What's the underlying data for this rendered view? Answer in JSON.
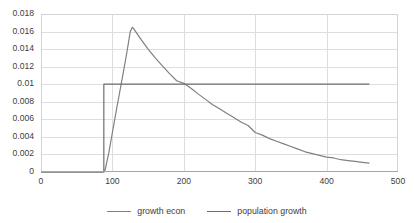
{
  "chart_data": {
    "type": "line",
    "title": "",
    "xlabel": "",
    "ylabel": "",
    "xlim": [
      0,
      500
    ],
    "ylim": [
      0,
      0.018
    ],
    "grid": true,
    "legend_position": "bottom",
    "x_ticks": [
      "0",
      "100",
      "200",
      "300",
      "400",
      "500"
    ],
    "x_tick_values": [
      0,
      100,
      200,
      300,
      400,
      500
    ],
    "y_ticks": [
      "0",
      "0.002",
      "0.004",
      "0.006",
      "0.008",
      "0.01",
      "0.012",
      "0.014",
      "0.016",
      "0.018"
    ],
    "y_tick_values": [
      0,
      0.002,
      0.004,
      0.006,
      0.008,
      0.01,
      0.012,
      0.014,
      0.016,
      0.018
    ],
    "series": [
      {
        "name": "growth econ",
        "color": "#808080",
        "x": [
          0,
          10,
          20,
          30,
          40,
          50,
          60,
          70,
          80,
          88,
          90,
          95,
          100,
          105,
          110,
          115,
          120,
          125,
          128,
          130,
          135,
          140,
          150,
          160,
          170,
          180,
          190,
          200,
          210,
          220,
          230,
          240,
          250,
          260,
          270,
          280,
          290,
          300,
          310,
          320,
          330,
          340,
          350,
          360,
          370,
          380,
          390,
          400,
          410,
          420,
          430,
          440,
          450,
          460
        ],
        "y": [
          0,
          0,
          0,
          0,
          0,
          0,
          0,
          0,
          0,
          0,
          0.0003,
          0.0022,
          0.0045,
          0.0068,
          0.009,
          0.0112,
          0.0135,
          0.016,
          0.0165,
          0.0163,
          0.0157,
          0.0151,
          0.014,
          0.013,
          0.0121,
          0.0112,
          0.0104,
          0.0101,
          0.00955,
          0.0089,
          0.0083,
          0.0077,
          0.0072,
          0.0067,
          0.0062,
          0.0057,
          0.0053,
          0.0045,
          0.0042,
          0.0038,
          0.0035,
          0.0032,
          0.0029,
          0.0026,
          0.0023,
          0.0021,
          0.0019,
          0.0017,
          0.0016,
          0.0014,
          0.0013,
          0.0012,
          0.0011,
          0.001
        ]
      },
      {
        "name": "population growth",
        "color": "#6e6e6e",
        "x": [
          0,
          20,
          40,
          60,
          80,
          87,
          88,
          88,
          100,
          150,
          200,
          250,
          300,
          350,
          400,
          450,
          460
        ],
        "y": [
          0,
          0,
          0,
          0,
          0,
          0,
          0,
          0.01,
          0.01,
          0.01,
          0.01,
          0.01,
          0.01,
          0.01,
          0.01,
          0.01,
          0.01
        ]
      }
    ],
    "annotations": {
      "peak_x": 128,
      "peak_y": 0.0165,
      "step_x": 88,
      "step_level": 0.01,
      "crossover_x": 210,
      "crossover_y": 0.01,
      "series_end_x": 460
    },
    "legend": [
      {
        "label": "growth econ",
        "color": "#808080"
      },
      {
        "label": "population growth",
        "color": "#6e6e6e"
      }
    ]
  }
}
